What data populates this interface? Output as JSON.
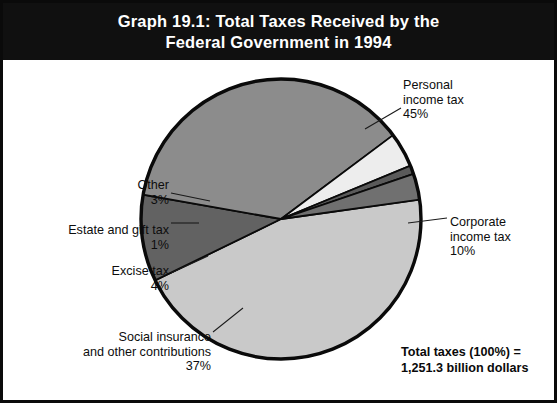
{
  "title": {
    "line1": "Graph 19.1:  Total Taxes Received by the",
    "line2": "Federal Government in 1994"
  },
  "footnote": {
    "line1": "Total taxes (100%) =",
    "line2": "1,251.3 billion dollars"
  },
  "labels": {
    "personal": {
      "line1": "Personal",
      "line2": "income tax",
      "line3": "45%"
    },
    "corporate": {
      "line1": "Corporate",
      "line2": "income tax",
      "line3": "10%"
    },
    "other": {
      "line1": "Other",
      "line2": "3%"
    },
    "estate": {
      "line1": "Estate and gift tax",
      "line2": "1%"
    },
    "excise": {
      "line1": "Excise tax",
      "line2": "4%"
    },
    "social": {
      "line1": "Social insurance",
      "line2": "and other contributions",
      "line3": "37%"
    }
  },
  "colors": {
    "title_bg": "#101010",
    "title_fg": "#ffffff",
    "outline": "#0a0a0a",
    "personal": "#c9c9c9",
    "corporate": "#626262",
    "social": "#8c8c8c",
    "excise": "#ededed",
    "estate": "#5a5a5a",
    "other": "#707070",
    "background": "#ffffff"
  },
  "chart_data": {
    "type": "pie",
    "title": "Graph 19.1:  Total Taxes Received by the Federal Government in 1994",
    "unit": "percent of total taxes",
    "total_label": "Total taxes (100%) = 1,251.3 billion dollars",
    "total_value": 1251.3,
    "total_unit": "billion dollars",
    "categories": [
      "Personal income tax",
      "Corporate income tax",
      "Social insurance and other contributions",
      "Excise tax",
      "Estate and gift tax",
      "Other"
    ],
    "values": [
      45,
      10,
      37,
      4,
      1,
      3
    ],
    "slice_colors": [
      "#c9c9c9",
      "#626262",
      "#8c8c8c",
      "#ededed",
      "#5a5a5a",
      "#707070"
    ],
    "start_angle_deg": -8,
    "direction": "clockwise",
    "legend": "none",
    "labels_position": "outside-with-leader-lines"
  }
}
